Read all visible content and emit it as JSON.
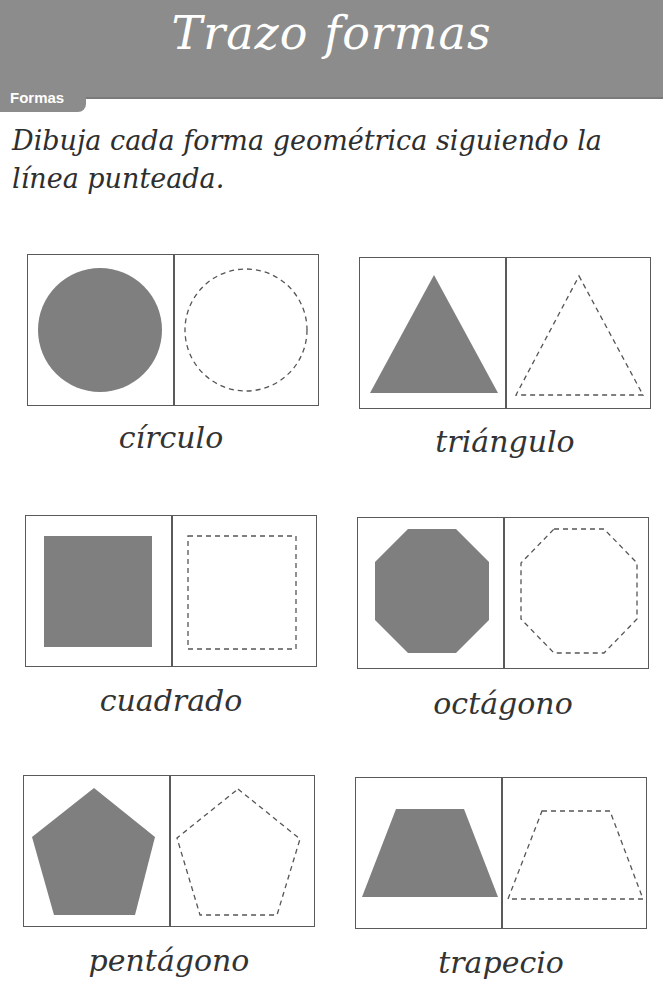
{
  "header": {
    "title": "Trazo formas",
    "tab_label": "Formas",
    "banner_color": "#8c8c8c"
  },
  "instructions": "Dibuja cada forma geométrica siguiendo la línea punteada.",
  "colors": {
    "shape_fill": "#7f7f7f",
    "dashed_stroke": "#555555",
    "card_border": "#5a5a5a"
  },
  "shapes": [
    {
      "name": "circle",
      "label": "círculo"
    },
    {
      "name": "triangle",
      "label": "triángulo"
    },
    {
      "name": "square",
      "label": "cuadrado"
    },
    {
      "name": "octagon",
      "label": "octágono"
    },
    {
      "name": "pentagon",
      "label": "pentágono"
    },
    {
      "name": "trapezoid",
      "label": "trapecio"
    }
  ]
}
